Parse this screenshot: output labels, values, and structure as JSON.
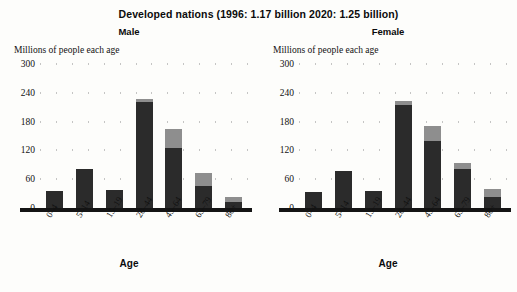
{
  "header": {
    "title": "Developed nations (1996: 1.17 billion   2020: 1.25 billion)"
  },
  "panels": [
    {
      "key": "male",
      "title": "Male",
      "y_axis_caption": "Millions of people each age",
      "x_axis_title": "Age"
    },
    {
      "key": "female",
      "title": "Female",
      "y_axis_caption": "Millions of people each age",
      "x_axis_title": "Age"
    }
  ],
  "colors": {
    "series_1996": "#2b2b2b",
    "series_2020": "#8e8e8e",
    "axis": "#141414",
    "grid_dot": "#8d8d8d",
    "text": "#111111",
    "background": "#fdfdfb"
  },
  "chart_data": [
    {
      "type": "bar",
      "title": "Male",
      "subtitle": "Developed nations (1996: 1.17 billion   2020: 1.25 billion)",
      "xlabel": "Age",
      "ylabel": "Millions of people each age",
      "categories": [
        "0–4",
        "5–14",
        "15–19",
        "20–44",
        "45–64",
        "65–79",
        "80+"
      ],
      "ticks": [
        0,
        60,
        120,
        180,
        240,
        300
      ],
      "ylim": [
        0,
        300
      ],
      "grid": "dotted",
      "stacked": true,
      "legend": "none",
      "series": [
        {
          "name": "1996",
          "values": [
            35,
            82,
            38,
            220,
            125,
            45,
            12
          ]
        },
        {
          "name": "2020 increment",
          "values": [
            0,
            0,
            0,
            8,
            40,
            28,
            12
          ]
        }
      ],
      "totals_2020": [
        35,
        82,
        38,
        228,
        165,
        73,
        24
      ]
    },
    {
      "type": "bar",
      "title": "Female",
      "subtitle": "Developed nations (1996: 1.17 billion   2020: 1.25 billion)",
      "xlabel": "Age",
      "ylabel": "Millions of people each age",
      "categories": [
        "0–4",
        "5–14",
        "15–19",
        "20–44",
        "45–64",
        "65–79",
        "80+"
      ],
      "ticks": [
        0,
        60,
        120,
        180,
        240,
        300
      ],
      "ylim": [
        0,
        300
      ],
      "grid": "dotted",
      "stacked": true,
      "legend": "none",
      "series": [
        {
          "name": "1996",
          "values": [
            33,
            78,
            36,
            215,
            140,
            82,
            22
          ]
        },
        {
          "name": "2020 increment",
          "values": [
            0,
            0,
            0,
            7,
            30,
            12,
            18
          ]
        }
      ],
      "totals_2020": [
        33,
        78,
        36,
        222,
        170,
        94,
        40
      ]
    }
  ]
}
